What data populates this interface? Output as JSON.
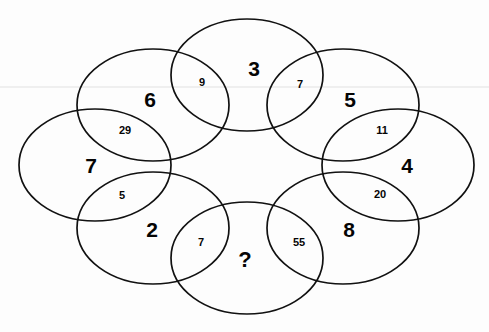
{
  "puzzle": {
    "type": "overlapping-ellipse-ring-number-puzzle",
    "canvas": {
      "width": 489,
      "height": 332,
      "background": "#ffffff"
    },
    "stroke_color": "#111111",
    "text_color": "#050505",
    "ellipses": [
      {
        "id": "ellipse-top",
        "label": "3",
        "cx": 247,
        "cy": 75,
        "rx": 76,
        "ry": 56,
        "label_x": 254,
        "label_y": 68
      },
      {
        "id": "ellipse-top-left",
        "label": "6",
        "cx": 153,
        "cy": 105,
        "rx": 76,
        "ry": 56,
        "label_x": 150,
        "label_y": 99
      },
      {
        "id": "ellipse-left",
        "label": "7",
        "cx": 95,
        "cy": 165,
        "rx": 76,
        "ry": 56,
        "label_x": 91,
        "label_y": 165
      },
      {
        "id": "ellipse-bottom-left",
        "label": "2",
        "cx": 153,
        "cy": 228,
        "rx": 76,
        "ry": 56,
        "label_x": 152,
        "label_y": 229
      },
      {
        "id": "ellipse-bottom",
        "label": "?",
        "cx": 247,
        "cy": 258,
        "rx": 76,
        "ry": 56,
        "label_x": 245,
        "label_y": 260
      },
      {
        "id": "ellipse-bottom-right",
        "label": "8",
        "cx": 343,
        "cy": 228,
        "rx": 76,
        "ry": 56,
        "label_x": 349,
        "label_y": 229
      },
      {
        "id": "ellipse-right",
        "label": "4",
        "cx": 398,
        "cy": 165,
        "rx": 76,
        "ry": 56,
        "label_x": 407,
        "label_y": 165
      },
      {
        "id": "ellipse-top-right",
        "label": "5",
        "cx": 343,
        "cy": 105,
        "rx": 76,
        "ry": 56,
        "label_x": 350,
        "label_y": 99
      }
    ],
    "intersections": [
      {
        "id": "intersection-6-3",
        "value": "9",
        "x": 202,
        "y": 82,
        "between": [
          "6",
          "3"
        ]
      },
      {
        "id": "intersection-3-5",
        "value": "7",
        "x": 300,
        "y": 84,
        "between": [
          "3",
          "5"
        ]
      },
      {
        "id": "intersection-5-4",
        "value": "11",
        "x": 382,
        "y": 130,
        "between": [
          "5",
          "4"
        ]
      },
      {
        "id": "intersection-4-8",
        "value": "20",
        "x": 380,
        "y": 194,
        "between": [
          "4",
          "8"
        ]
      },
      {
        "id": "intersection-8-q",
        "value": "55",
        "x": 299,
        "y": 242,
        "between": [
          "8",
          "?"
        ]
      },
      {
        "id": "intersection-q-2",
        "value": "7",
        "x": 201,
        "y": 242,
        "between": [
          "?",
          "2"
        ]
      },
      {
        "id": "intersection-2-7",
        "value": "5",
        "x": 122,
        "y": 195,
        "between": [
          "2",
          "7"
        ]
      },
      {
        "id": "intersection-7-6",
        "value": "29",
        "x": 125,
        "y": 130,
        "between": [
          "7",
          "6"
        ]
      }
    ]
  }
}
